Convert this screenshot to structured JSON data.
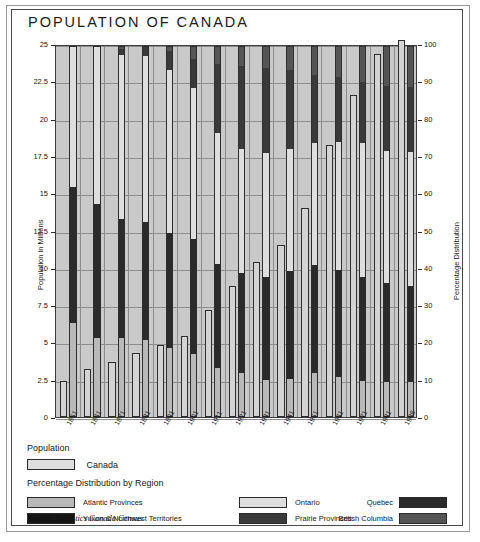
{
  "title": "POPULATION OF CANADA",
  "source": "Source: Statistics Canada Census",
  "axes": {
    "left_title": "Population in Millions",
    "right_title": "Percentage Distribution",
    "left_ticks": [
      "0",
      "2.5",
      "5",
      "7.5",
      "10",
      "12.5",
      "15",
      "17.5",
      "20",
      "22.5",
      "25"
    ],
    "right_ticks": [
      "0",
      "10",
      "20",
      "30",
      "40",
      "50",
      "60",
      "70",
      "80",
      "90",
      "100"
    ],
    "left_min": 0,
    "left_max": 25,
    "right_min": 0,
    "right_max": 100
  },
  "legend": {
    "population_head": "Population",
    "population_label": "Canada",
    "distribution_head": "Percentage Distribution by Region",
    "items": [
      {
        "label": "Atlantic Provinces",
        "color": "#b9b9b9",
        "side": "left"
      },
      {
        "label": "Yukon & Northwest Territories",
        "color": "#161616",
        "side": "left"
      },
      {
        "label": "Ontario",
        "color": "#dedede",
        "side": "mid"
      },
      {
        "label": "Prairie Provinces",
        "color": "#3a3a3a",
        "side": "mid"
      },
      {
        "label": "Québec",
        "color": "#2b2b2b",
        "side": "right"
      },
      {
        "label": "British Columbia",
        "color": "#555555",
        "side": "right"
      }
    ]
  },
  "chart_data": {
    "type": "bar",
    "title": "POPULATION OF CANADA",
    "xlabel": "",
    "ylabel": "Population in Millions",
    "y2label": "Percentage Distribution",
    "ylim": [
      0,
      25
    ],
    "y2lim": [
      0,
      100
    ],
    "grid": true,
    "legend_position": "bottom",
    "categories": [
      "1851",
      "1861",
      "1871",
      "1881",
      "1891",
      "1901",
      "1911",
      "1921",
      "1931",
      "1941",
      "1951",
      "1961",
      "1971",
      "1981",
      "1986"
    ],
    "series": [
      {
        "name": "Canada",
        "units": "millions",
        "axis": "left",
        "values": [
          2.4,
          3.2,
          3.7,
          4.3,
          4.8,
          5.4,
          7.2,
          8.8,
          10.4,
          11.5,
          14.0,
          18.2,
          21.6,
          24.3,
          25.3
        ]
      }
    ],
    "stacked_percent_series": [
      {
        "name": "Atlantic Provinces",
        "color": "#b9b9b9",
        "values": [
          25.0,
          20.8,
          20.8,
          20.5,
          18.3,
          16.7,
          13.0,
          11.4,
          9.6,
          9.8,
          11.6,
          10.4,
          9.5,
          9.2,
          9.0
        ]
      },
      {
        "name": "Québec",
        "color": "#2b2b2b",
        "values": [
          36.5,
          36.0,
          32.0,
          31.4,
          30.8,
          30.7,
          27.8,
          26.9,
          27.7,
          29.0,
          28.9,
          28.8,
          27.9,
          26.4,
          25.8
        ]
      },
      {
        "name": "Ontario",
        "color": "#dedede",
        "values": [
          38.5,
          43.2,
          43.9,
          44.6,
          43.7,
          40.6,
          35.1,
          33.4,
          33.1,
          32.9,
          32.8,
          34.2,
          35.7,
          35.4,
          35.9
        ]
      },
      {
        "name": "Prairie Provinces",
        "color": "#3a3a3a",
        "values": [
          0.0,
          0.0,
          1.6,
          2.4,
          5.1,
          7.8,
          18.4,
          22.2,
          22.8,
          21.0,
          18.2,
          17.4,
          16.4,
          17.4,
          17.4
        ]
      },
      {
        "name": "British Columbia",
        "color": "#555555",
        "values": [
          0.0,
          0.0,
          1.0,
          1.1,
          2.0,
          3.3,
          5.4,
          6.0,
          6.7,
          7.1,
          8.3,
          8.9,
          10.1,
          11.3,
          11.5
        ]
      },
      {
        "name": "Yukon & Northwest Territories",
        "color": "#161616",
        "values": [
          0.0,
          0.0,
          0.7,
          0.0,
          0.1,
          0.9,
          0.3,
          0.1,
          0.1,
          0.2,
          0.2,
          0.3,
          0.4,
          0.3,
          0.4
        ]
      }
    ]
  }
}
